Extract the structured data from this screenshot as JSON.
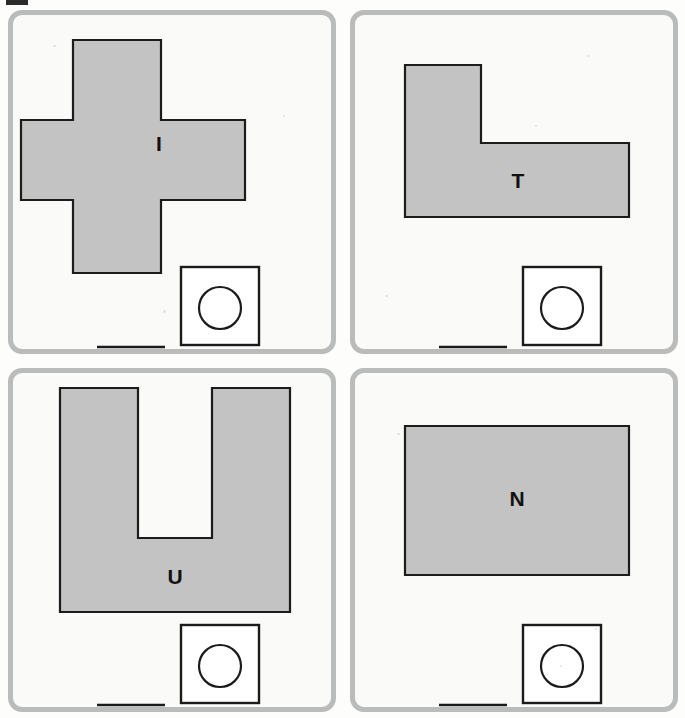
{
  "figure": {
    "panel_count": 4,
    "layout": "2x2 grid",
    "background_color": "#fdfdfc",
    "panel_border_color": "#b9bcbb",
    "shape_fill_color": "#c3c3c3",
    "shape_outline_color": "#1c1c1c"
  },
  "panels": [
    {
      "id": "panel-a",
      "position": "top-left",
      "label": "I",
      "shape_name": "cross",
      "shape_points": "60,25 60,105 8,105 8,185 60,185 60,258 148,258 148,185 232,185 232,105 148,105 148,25",
      "label_x": 146,
      "label_y": 130,
      "scalebar": {
        "name": "scale-bar",
        "x1": 84,
        "y1": 332,
        "x2": 152,
        "y2": 332
      },
      "legend": {
        "name": "circle-in-square-marker",
        "square_x": 168,
        "square_y": 252,
        "square_size": 78,
        "circle_cx": 207,
        "circle_cy": 293,
        "circle_r": 21
      }
    },
    {
      "id": "panel-b",
      "position": "top-right",
      "label": "T",
      "shape_name": "L-shape",
      "shape_points": "50,50 50,202 274,202 274,128 126,128 126,50",
      "label_x": 163,
      "label_y": 167,
      "scalebar": {
        "name": "scale-bar",
        "x1": 84,
        "y1": 332,
        "x2": 152,
        "y2": 332
      },
      "legend": {
        "name": "circle-in-square-marker",
        "square_x": 168,
        "square_y": 252,
        "square_size": 78,
        "circle_cx": 207,
        "circle_cy": 293,
        "circle_r": 21
      }
    },
    {
      "id": "panel-c",
      "position": "bottom-left",
      "label": "U",
      "shape_name": "U-shape",
      "shape_points": "47,15 47,239 277,239 277,15 199,15 199,165 125,165 125,15",
      "label_x": 162,
      "label_y": 205,
      "scalebar": {
        "name": "scale-bar",
        "x1": 84,
        "y1": 332,
        "x2": 152,
        "y2": 332
      },
      "legend": {
        "name": "circle-in-square-marker",
        "square_x": 168,
        "square_y": 252,
        "square_size": 78,
        "circle_cx": 207,
        "circle_cy": 293,
        "circle_r": 21
      }
    },
    {
      "id": "panel-d",
      "position": "bottom-right",
      "label": "N",
      "shape_name": "rectangle",
      "shape_points": "50,53 50,202 274,202 274,53",
      "label_x": 162,
      "label_y": 127,
      "scalebar": {
        "name": "scale-bar",
        "x1": 84,
        "y1": 332,
        "x2": 152,
        "y2": 332
      },
      "legend": {
        "name": "circle-in-square-marker",
        "square_x": 168,
        "square_y": 252,
        "square_size": 78,
        "circle_cx": 207,
        "circle_cy": 293,
        "circle_r": 21
      }
    }
  ]
}
